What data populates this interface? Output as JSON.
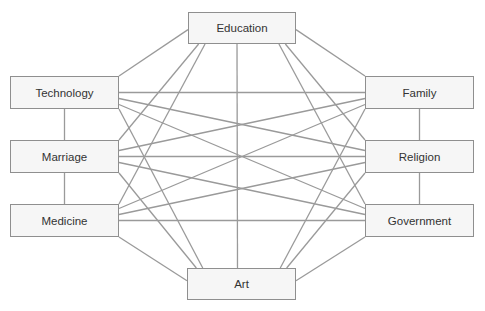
{
  "diagram": {
    "type": "network-diagram",
    "line_color": "#9a9a9a",
    "box_fill": "#f6f6f6",
    "box_border": "#8f8f8f",
    "nodes": [
      {
        "id": "education",
        "label": "Education",
        "x": 188,
        "y": 12,
        "w": 108,
        "h": 32
      },
      {
        "id": "technology",
        "label": "Technology",
        "x": 10,
        "y": 76,
        "w": 109,
        "h": 33
      },
      {
        "id": "marriage",
        "label": "Marriage",
        "x": 10,
        "y": 140,
        "w": 109,
        "h": 33
      },
      {
        "id": "medicine",
        "label": "Medicine",
        "x": 10,
        "y": 204,
        "w": 109,
        "h": 33
      },
      {
        "id": "family",
        "label": "Family",
        "x": 365,
        "y": 76,
        "w": 109,
        "h": 33
      },
      {
        "id": "religion",
        "label": "Religion",
        "x": 365,
        "y": 140,
        "w": 109,
        "h": 33
      },
      {
        "id": "government",
        "label": "Government",
        "x": 365,
        "y": 204,
        "w": 109,
        "h": 33
      },
      {
        "id": "art",
        "label": "Art",
        "x": 187,
        "y": 268,
        "w": 109,
        "h": 32
      }
    ],
    "edges": [
      [
        "education",
        "technology"
      ],
      [
        "education",
        "marriage"
      ],
      [
        "education",
        "medicine"
      ],
      [
        "education",
        "family"
      ],
      [
        "education",
        "religion"
      ],
      [
        "education",
        "government"
      ],
      [
        "education",
        "art"
      ],
      [
        "technology",
        "marriage"
      ],
      [
        "marriage",
        "medicine"
      ],
      [
        "family",
        "religion"
      ],
      [
        "religion",
        "government"
      ],
      [
        "technology",
        "family"
      ],
      [
        "technology",
        "religion"
      ],
      [
        "technology",
        "government"
      ],
      [
        "marriage",
        "family"
      ],
      [
        "marriage",
        "religion"
      ],
      [
        "marriage",
        "government"
      ],
      [
        "medicine",
        "family"
      ],
      [
        "medicine",
        "religion"
      ],
      [
        "medicine",
        "government"
      ],
      [
        "art",
        "technology"
      ],
      [
        "art",
        "marriage"
      ],
      [
        "art",
        "medicine"
      ],
      [
        "art",
        "family"
      ],
      [
        "art",
        "religion"
      ],
      [
        "art",
        "government"
      ]
    ]
  }
}
